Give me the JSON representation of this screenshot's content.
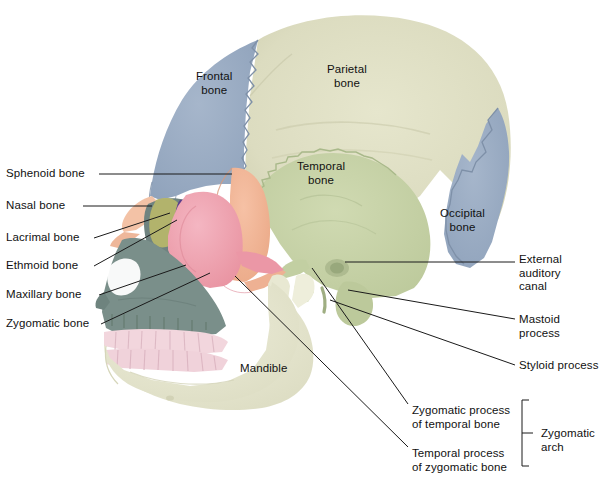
{
  "figure": {
    "background": "#ffffff",
    "width": 601,
    "height": 479
  },
  "palette": {
    "frontal": "#96a8c0",
    "parietal": "#dcdcc0",
    "temporal": "#c6d2a6",
    "occipital": "#8fa2bb",
    "sphenoid": "#f0b394",
    "zygomatic": "#efa2b2",
    "maxilla": "#7a8f8a",
    "mandible": "#e6e6cd",
    "nasal": "#f3c2a6",
    "lacrimal": "#b5b56a",
    "ethmoid": "#5b3f8c",
    "teeth": "#f2d6dd",
    "leader_line": "#1a1a1a",
    "text": "#111111"
  },
  "labels_on_skull": [
    {
      "name": "frontal-bone",
      "text": "Frontal\nbone",
      "x": 196,
      "y": 70
    },
    {
      "name": "parietal-bone",
      "text": "Parietal\nbone",
      "x": 327,
      "y": 63
    },
    {
      "name": "temporal-bone",
      "text": "Temporal\nbone",
      "x": 297,
      "y": 160
    },
    {
      "name": "occipital-bone",
      "text": "Occipital\nbone",
      "x": 440,
      "y": 207
    },
    {
      "name": "mandible",
      "text": "Mandible",
      "x": 240,
      "y": 362
    }
  ],
  "labels_left": [
    {
      "name": "sphenoid-bone",
      "text": "Sphenoid bone",
      "x": 6,
      "y": 167,
      "line": {
        "x1": 99,
        "y1": 174,
        "x2": 232,
        "y2": 174
      }
    },
    {
      "name": "nasal-bone",
      "text": "Nasal bone",
      "x": 6,
      "y": 199,
      "line": {
        "x1": 83,
        "y1": 206,
        "x2": 152,
        "y2": 206
      }
    },
    {
      "name": "lacrimal-bone",
      "text": "Lacrimal bone",
      "x": 6,
      "y": 231,
      "line": {
        "x1": 94,
        "y1": 238,
        "x2": 170,
        "y2": 213
      }
    },
    {
      "name": "ethmoid-bone",
      "text": "Ethmoid bone",
      "x": 6,
      "y": 259,
      "line": {
        "x1": 94,
        "y1": 266,
        "x2": 177,
        "y2": 220
      }
    },
    {
      "name": "maxillary-bone",
      "text": "Maxillary bone",
      "x": 6,
      "y": 288,
      "line": {
        "x1": 99,
        "y1": 295,
        "x2": 186,
        "y2": 265
      }
    },
    {
      "name": "zygomatic-bone",
      "text": "Zygomatic bone",
      "x": 6,
      "y": 317,
      "line": {
        "x1": 101,
        "y1": 324,
        "x2": 210,
        "y2": 273
      }
    }
  ],
  "labels_right": [
    {
      "name": "external-auditory-canal",
      "text": "External auditory\ncanal",
      "x": 519,
      "y": 253,
      "line": {
        "x1": 345,
        "y1": 262,
        "x2": 515,
        "y2": 262
      }
    },
    {
      "name": "mastoid-process",
      "text": "Mastoid process",
      "x": 519,
      "y": 313,
      "line": {
        "x1": 348,
        "y1": 290,
        "x2": 515,
        "y2": 319
      }
    },
    {
      "name": "styloid-process",
      "text": "Styloid process",
      "x": 519,
      "y": 359,
      "line": {
        "x1": 330,
        "y1": 300,
        "x2": 515,
        "y2": 365
      }
    }
  ],
  "labels_arch": [
    {
      "name": "zygomatic-process-of-temporal-bone",
      "text": "Zygomatic process\nof temporal bone",
      "x": 412,
      "y": 404,
      "line": {
        "x1": 312,
        "y1": 268,
        "x2": 408,
        "y2": 404
      }
    },
    {
      "name": "temporal-process-of-zygomatic-bone",
      "text": "Temporal process\nof zygomatic bone",
      "x": 412,
      "y": 447,
      "line": {
        "x1": 235,
        "y1": 276,
        "x2": 408,
        "y2": 447
      }
    }
  ],
  "brace": {
    "name": "zygomatic-arch-brace",
    "label": "Zygomatic\narch",
    "label_x": 541,
    "label_y": 427,
    "top": 400,
    "bottom": 466,
    "x": 522,
    "tick_x": 533,
    "tick_y": 433
  }
}
